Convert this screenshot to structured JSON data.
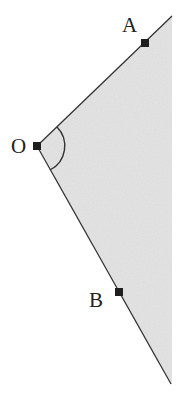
{
  "diagram": {
    "type": "angle",
    "colors": {
      "background": "#ffffff",
      "shading": "#e6e6e6",
      "line": "#333333",
      "point": "#1e1e1e",
      "label": "#222222"
    },
    "points": [
      {
        "id": "O",
        "label": "O",
        "x": 37,
        "y": 146
      },
      {
        "id": "A",
        "label": "A",
        "x": 145,
        "y": 43
      },
      {
        "id": "B",
        "label": "B",
        "x": 119,
        "y": 292
      }
    ],
    "rays": [
      {
        "from": "O",
        "through": "A",
        "end": {
          "x": 172,
          "y": 16
        }
      },
      {
        "from": "O",
        "through": "B",
        "end": {
          "x": 171,
          "y": 384
        }
      }
    ],
    "angle_arc": {
      "vertex": "O",
      "radius": 27
    },
    "labels": {
      "O": "O",
      "A": "A",
      "B": "B"
    }
  }
}
